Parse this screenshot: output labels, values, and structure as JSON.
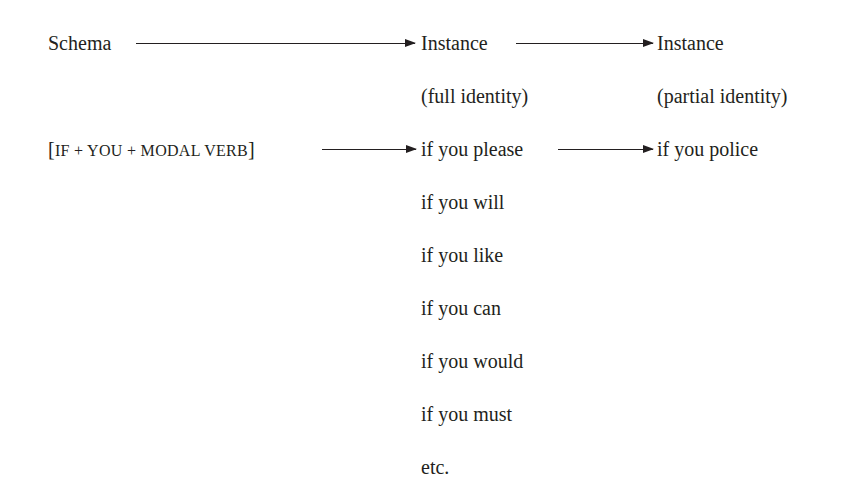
{
  "diagram": {
    "header": {
      "schema_label": "Schema",
      "instance_full_label": "Instance",
      "instance_full_sublabel": "(full identity)",
      "instance_partial_label": "Instance",
      "instance_partial_sublabel": "(partial identity)"
    },
    "schema": {
      "open_bracket": "[",
      "formula": "IF + YOU + MODAL VERB",
      "close_bracket": "]"
    },
    "full_identity_instances": [
      "if you please",
      "if you will",
      "if you like",
      "if you can",
      "if you would",
      "if you must",
      "etc."
    ],
    "partial_identity_instance": "if you police",
    "arrows": [
      {
        "from": "Schema",
        "to": "Instance (full identity)"
      },
      {
        "from": "Instance (full identity)",
        "to": "Instance (partial identity)"
      },
      {
        "from": "[IF + YOU + MODAL VERB]",
        "to": "if you please"
      },
      {
        "from": "if you please",
        "to": "if you police"
      }
    ],
    "colors": {
      "text": "#231f20",
      "background": "#ffffff"
    }
  }
}
